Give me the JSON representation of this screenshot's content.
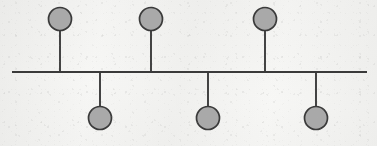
{
  "figure": {
    "kind": "stem-diagram",
    "canvas": {
      "width": 377,
      "height": 146
    },
    "colors": {
      "background": "#f6f6f4",
      "stroke": "#3a3a3a",
      "node_fill": "#a9a9a9"
    },
    "baseline": {
      "y": 72,
      "x_start": 12,
      "x_end": 367,
      "thickness": 2.1
    },
    "node_radius": 11.5,
    "nodes": [
      {
        "id": "node-1",
        "side": "above",
        "x": 60,
        "circle_y": 19,
        "stem_from_y": 30.5,
        "stem_to_y": 72
      },
      {
        "id": "node-2",
        "side": "below",
        "x": 100,
        "circle_y": 118,
        "stem_from_y": 72,
        "stem_to_y": 106.5
      },
      {
        "id": "node-3",
        "side": "above",
        "x": 151,
        "circle_y": 19,
        "stem_from_y": 30.5,
        "stem_to_y": 72
      },
      {
        "id": "node-4",
        "side": "below",
        "x": 208,
        "circle_y": 118,
        "stem_from_y": 72,
        "stem_to_y": 106.5
      },
      {
        "id": "node-5",
        "side": "above",
        "x": 265,
        "circle_y": 19,
        "stem_from_y": 30.5,
        "stem_to_y": 72
      },
      {
        "id": "node-6",
        "side": "below",
        "x": 316,
        "circle_y": 118,
        "stem_from_y": 72,
        "stem_to_y": 106.5
      }
    ]
  }
}
